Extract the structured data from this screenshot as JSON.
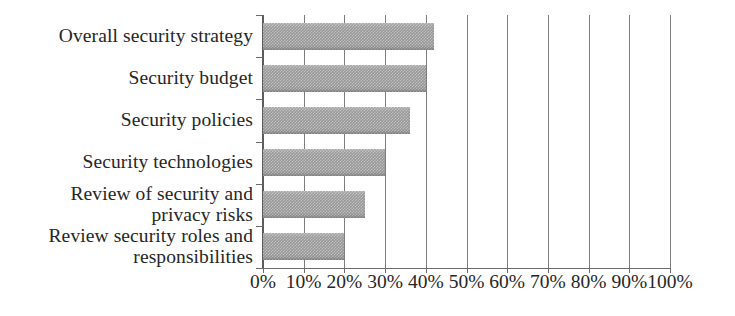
{
  "chart_data": {
    "type": "bar",
    "orientation": "horizontal",
    "title": "",
    "subtitle": "",
    "xlabel": "",
    "ylabel": "",
    "categories": [
      "Overall security strategy",
      "Security budget",
      "Security policies",
      "Security technologies",
      "Review of security and\nprivacy risks",
      "Review security roles and\nresponsibilities"
    ],
    "values": [
      42,
      40,
      36,
      30,
      25,
      20
    ],
    "value_suffix": "%",
    "xlim": [
      0,
      100
    ],
    "xticks": [
      0,
      10,
      20,
      30,
      40,
      50,
      60,
      70,
      80,
      90,
      100
    ],
    "xticklabels": [
      "0%",
      "10%",
      "20%",
      "30%",
      "40%",
      "50%",
      "60%",
      "70%",
      "80%",
      "90%",
      "100%"
    ],
    "grid": true,
    "grid_axis": "x",
    "legend": false,
    "legend_position": "none",
    "series": [
      {
        "name": "",
        "values": [
          42,
          40,
          36,
          30,
          25,
          20
        ]
      }
    ],
    "colors": {
      "bar_fill": "#989898",
      "axis": "#6b6b6b",
      "gridline": "#7d7d7d",
      "text": "#262626",
      "background": "#ffffff"
    }
  }
}
